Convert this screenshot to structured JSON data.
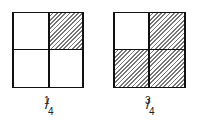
{
  "figures": [
    {
      "label": {
        "numerator": "1",
        "denominator": "4",
        "slash": "/"
      },
      "shaded_cells": [
        "top-right"
      ]
    },
    {
      "label": {
        "numerator": "3",
        "denominator": "4",
        "slash": "/"
      },
      "shaded_cells": [
        "top-right",
        "bottom-left",
        "bottom-right"
      ]
    }
  ],
  "colors": {
    "line": "#111111",
    "hatch": "#777777",
    "background": "#ffffff"
  }
}
